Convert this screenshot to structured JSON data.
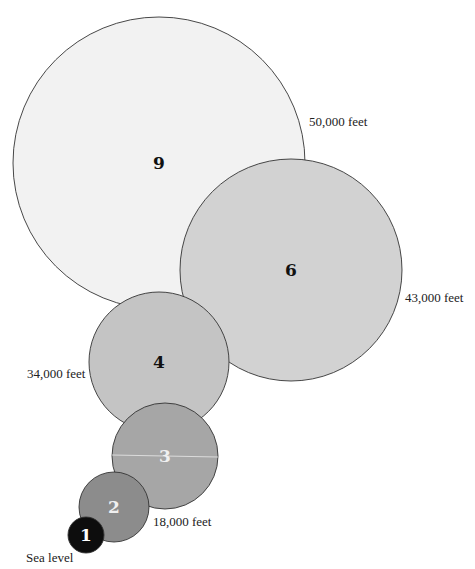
{
  "diagram": {
    "type": "nested-circle-size-comparison",
    "circles": [
      {
        "id": "9",
        "label": "9",
        "cx": 159,
        "cy": 163,
        "r": 146,
        "fill": "#f2f2f2",
        "text_color": "#111111"
      },
      {
        "id": "6",
        "label": "6",
        "cx": 291,
        "cy": 270,
        "r": 111,
        "fill": "#d2d2d2",
        "text_color": "#111111"
      },
      {
        "id": "4",
        "label": "4",
        "cx": 159,
        "cy": 362,
        "r": 70,
        "fill": "#c4c4c4",
        "text_color": "#111111"
      },
      {
        "id": "3",
        "label": "3",
        "cx": 165,
        "cy": 456,
        "r": 53,
        "fill": "#a6a6a6",
        "text_color": "#f0f0f0"
      },
      {
        "id": "2",
        "label": "2",
        "cx": 114,
        "cy": 507,
        "r": 35,
        "fill": "#8c8c8c",
        "text_color": "#f0f0f0"
      },
      {
        "id": "1",
        "label": "1",
        "cx": 86,
        "cy": 535,
        "r": 18,
        "fill": "#0d0d0d",
        "text_color": "#ffffff"
      }
    ],
    "altitude_labels": [
      {
        "text": "50,000 feet",
        "x": 309,
        "y": 114
      },
      {
        "text": "43,000 feet",
        "x": 405,
        "y": 290
      },
      {
        "text": "34,000 feet",
        "x": 27,
        "y": 366
      },
      {
        "text": "18,000 feet",
        "x": 153,
        "y": 514
      },
      {
        "text": "Sea level",
        "x": 26,
        "y": 550
      }
    ]
  }
}
